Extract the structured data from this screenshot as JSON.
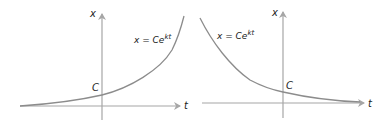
{
  "panels": [
    {
      "id": "growth",
      "axis_x_label": "t",
      "axis_y_label": "x",
      "intercept_label": "C",
      "equation": {
        "lhs": "x = Ce",
        "exponent": "kt"
      },
      "curve": "increasing exponential"
    },
    {
      "id": "decay",
      "axis_x_label": "t",
      "axis_y_label": "x",
      "intercept_label": "C",
      "equation": {
        "lhs": "x = Ce",
        "exponent": "kt"
      },
      "curve": "decreasing exponential"
    }
  ],
  "colors": {
    "axis": "#a6a6a6",
    "curve": "#8c8c8c",
    "text": "#222222"
  }
}
